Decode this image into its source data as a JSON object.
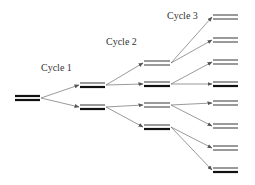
{
  "diagram": {
    "colors": {
      "original_strand": "#111111",
      "new_strand": "#9a9a9a",
      "arrow": "#555555",
      "text": "#333333"
    },
    "labels": [
      {
        "id": "cycle1",
        "text": "Cycle 1",
        "x": 41,
        "y": 71
      },
      {
        "id": "cycle2",
        "text": "Cycle 2",
        "x": 106,
        "y": 45
      },
      {
        "id": "cycle3",
        "text": "Cycle 3",
        "x": 167,
        "y": 19
      }
    ],
    "template": {
      "x1": 15,
      "x2": 40,
      "top_y": 96,
      "bottom_y": 100,
      "top": "original",
      "bottom": "original"
    },
    "cycle1": [
      {
        "x1": 80,
        "x2": 105,
        "top_y": 83,
        "bottom_y": 87,
        "top": "new",
        "bottom": "original"
      },
      {
        "x1": 80,
        "x2": 105,
        "top_y": 105,
        "bottom_y": 109,
        "top": "new",
        "bottom": "original"
      }
    ],
    "cycle2": [
      {
        "x1": 144,
        "x2": 170,
        "top_y": 61,
        "bottom_y": 65,
        "top": "new",
        "bottom": "new"
      },
      {
        "x1": 144,
        "x2": 170,
        "top_y": 82,
        "bottom_y": 86,
        "top": "new",
        "bottom": "original"
      },
      {
        "x1": 144,
        "x2": 170,
        "top_y": 103,
        "bottom_y": 107,
        "top": "new",
        "bottom": "new"
      },
      {
        "x1": 144,
        "x2": 170,
        "top_y": 125,
        "bottom_y": 129,
        "top": "new",
        "bottom": "original"
      }
    ],
    "cycle3": [
      {
        "x1": 213,
        "x2": 238,
        "top_y": 15,
        "bottom_y": 19,
        "top": "new",
        "bottom": "new"
      },
      {
        "x1": 213,
        "x2": 238,
        "top_y": 38,
        "bottom_y": 42,
        "top": "new",
        "bottom": "new"
      },
      {
        "x1": 213,
        "x2": 238,
        "top_y": 60,
        "bottom_y": 64,
        "top": "new",
        "bottom": "new"
      },
      {
        "x1": 213,
        "x2": 238,
        "top_y": 82,
        "bottom_y": 86,
        "top": "new",
        "bottom": "original"
      },
      {
        "x1": 213,
        "x2": 238,
        "top_y": 101,
        "bottom_y": 105,
        "top": "new",
        "bottom": "new"
      },
      {
        "x1": 213,
        "x2": 238,
        "top_y": 124,
        "bottom_y": 128,
        "top": "new",
        "bottom": "new"
      },
      {
        "x1": 213,
        "x2": 238,
        "top_y": 146,
        "bottom_y": 150,
        "top": "new",
        "bottom": "new"
      },
      {
        "x1": 213,
        "x2": 238,
        "top_y": 168,
        "bottom_y": 172,
        "top": "new",
        "bottom": "original"
      }
    ],
    "arrows": [
      {
        "from": "template",
        "to": "cycle1.0"
      },
      {
        "from": "template",
        "to": "cycle1.1"
      },
      {
        "from": "cycle1.0",
        "to": "cycle2.0"
      },
      {
        "from": "cycle1.0",
        "to": "cycle2.1"
      },
      {
        "from": "cycle1.1",
        "to": "cycle2.2"
      },
      {
        "from": "cycle1.1",
        "to": "cycle2.3"
      },
      {
        "from": "cycle2.0",
        "to": "cycle3.0"
      },
      {
        "from": "cycle2.0",
        "to": "cycle3.1"
      },
      {
        "from": "cycle2.1",
        "to": "cycle3.2"
      },
      {
        "from": "cycle2.1",
        "to": "cycle3.3"
      },
      {
        "from": "cycle2.2",
        "to": "cycle3.4"
      },
      {
        "from": "cycle2.2",
        "to": "cycle3.5"
      },
      {
        "from": "cycle2.3",
        "to": "cycle3.6"
      },
      {
        "from": "cycle2.3",
        "to": "cycle3.7"
      }
    ]
  }
}
